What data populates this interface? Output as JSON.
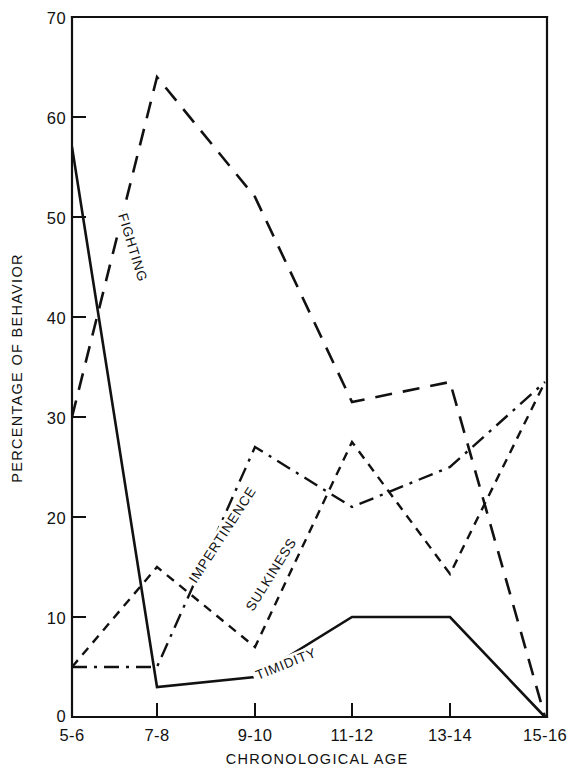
{
  "chart_data": {
    "type": "line",
    "title": "",
    "xlabel": "CHRONOLOGICAL AGE",
    "ylabel": "PERCENTAGE OF BEHAVIOR",
    "categories": [
      "5-6",
      "7-8",
      "9-10",
      "11-12",
      "13-14",
      "15-16"
    ],
    "x_tick_labels": [
      "5-6",
      "7-8",
      "9-10",
      "11-12",
      "13-14",
      "15-16"
    ],
    "y_tick_labels": [
      "0",
      "10",
      "20",
      "30",
      "40",
      "50",
      "60",
      "70"
    ],
    "y_ticks": [
      0,
      10,
      20,
      30,
      40,
      50,
      60,
      70
    ],
    "ylim": [
      0,
      70
    ],
    "grid": false,
    "legend": "inline-labels",
    "series": [
      {
        "name": "FIGHTING",
        "label": "FIGHTING",
        "stroke_style": "long-dash",
        "values": [
          30,
          64,
          52,
          31.5,
          33.5,
          0
        ]
      },
      {
        "name": "IMPERTINENCE",
        "label": "IMPERTINENCE",
        "stroke_style": "dash-dot",
        "values": [
          5,
          5,
          27,
          21,
          25,
          33.5
        ]
      },
      {
        "name": "SULKINESS",
        "label": "SULKINESS",
        "stroke_style": "short-dash",
        "values": [
          5,
          15,
          7,
          27.5,
          14.3,
          33.5
        ]
      },
      {
        "name": "TIMIDITY",
        "label": "TIMIDITY",
        "stroke_style": "solid",
        "values": [
          57,
          3,
          4,
          10,
          10,
          0
        ]
      }
    ]
  },
  "axes": {
    "x_axis_title": "CHRONOLOGICAL AGE",
    "y_axis_title": "PERCENTAGE OF BEHAVIOR"
  }
}
